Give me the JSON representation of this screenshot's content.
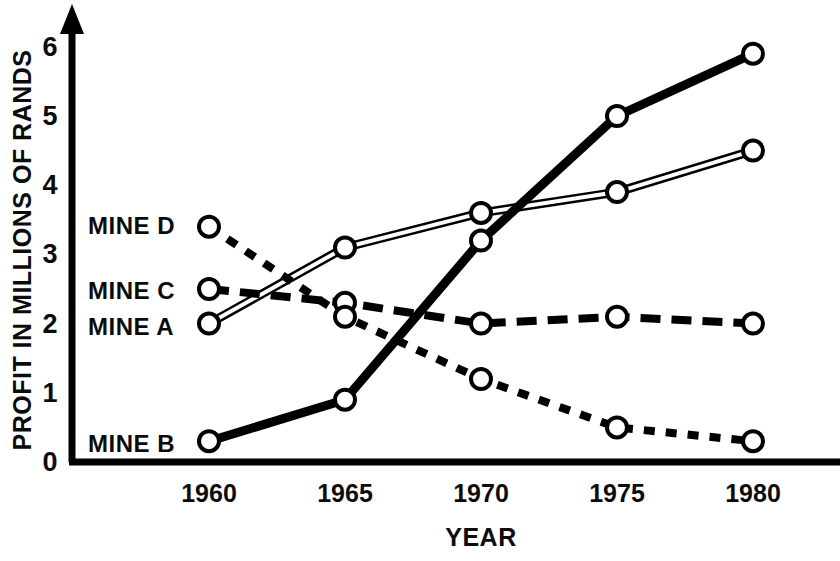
{
  "chart_data": {
    "type": "line",
    "title": "",
    "xlabel": "YEAR",
    "ylabel": "PROFIT IN MILLIONS OF RANDS",
    "x": [
      1960,
      1965,
      1970,
      1975,
      1980
    ],
    "xtick_labels": [
      "1960",
      "1965",
      "1970",
      "1975",
      "1980"
    ],
    "ytick_labels": [
      "0",
      "1",
      "2",
      "3",
      "4",
      "5",
      "6"
    ],
    "ytick_values": [
      0,
      1,
      2,
      3,
      4,
      5,
      6
    ],
    "xlim": [
      1958.5,
      1981.5
    ],
    "ylim": [
      0,
      6.2
    ],
    "grid": false,
    "legend_position": "inline-left",
    "marker": "open-circle",
    "series": [
      {
        "name": "MINE A",
        "label": "MINE A",
        "values": [
          2.0,
          3.1,
          3.6,
          3.9,
          4.5
        ],
        "style": "double-thin-solid",
        "color": "#000000",
        "label_y": 2.05
      },
      {
        "name": "MINE B",
        "label": "MINE B",
        "values": [
          0.3,
          0.9,
          3.2,
          5.0,
          5.9
        ],
        "style": "thick-solid",
        "color": "#000000",
        "label_y": 0.28
      },
      {
        "name": "MINE C",
        "label": "MINE C",
        "values": [
          2.5,
          2.3,
          2.0,
          2.1,
          2.0
        ],
        "style": "long-dashed",
        "color": "#000000",
        "label_y": 2.52
      },
      {
        "name": "MINE D",
        "label": "MINE D",
        "values": [
          3.4,
          2.1,
          1.2,
          0.5,
          0.3
        ],
        "style": "short-dotted",
        "color": "#000000",
        "label_y": 3.45
      }
    ]
  },
  "axes": {
    "y_arrow": true,
    "axis_color": "#000000"
  }
}
